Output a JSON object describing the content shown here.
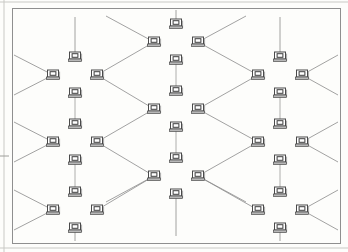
{
  "document": {
    "kind": "scanned-figure",
    "title": "Network topology diagram",
    "page_background": "#fdfdfb",
    "scan_edges": {
      "top_rule_y": 2,
      "left_rule_x": 4,
      "bottom_rule_y": 248,
      "left_tick_y": 156,
      "color": "#c9c9c5"
    }
  },
  "figure": {
    "frame": {
      "x": 12,
      "y": 8,
      "width": 328,
      "height": 235,
      "stroke": "#8f8f8f",
      "stroke_width": 1,
      "fill": "none"
    },
    "link_color": "#8a8a8a",
    "link_width": 0.8,
    "vertical_link_color": "#9a9a9a",
    "icon": {
      "name": "computer-monitor-icon",
      "screen_fill": "#ffffff",
      "screen_stroke": "#4a4a4a",
      "inner_fill": "#ffffff",
      "inner_stroke": "#3c3c3c",
      "base_fill": "#b8b8b8",
      "shadow_fill": "#b0b0b0",
      "width": 11,
      "height": 10
    },
    "cluster_offsets": {
      "left_dx": -22,
      "right_dx": 22,
      "top_dy": -18,
      "bottom_dy": 18
    },
    "clusters": [
      {
        "id": "c-l1",
        "label": "cluster-left-1",
        "column": "left",
        "row": 1,
        "cx": 75,
        "cy": 75
      },
      {
        "id": "c-l2",
        "label": "cluster-left-2",
        "column": "left",
        "row": 2,
        "cx": 75,
        "cy": 142
      },
      {
        "id": "c-l3",
        "label": "cluster-left-3",
        "column": "left",
        "row": 3,
        "cx": 75,
        "cy": 210
      },
      {
        "id": "c-m1",
        "label": "cluster-middle-1",
        "column": "middle",
        "row": 1,
        "cx": 176,
        "cy": 42
      },
      {
        "id": "c-m2",
        "label": "cluster-middle-2",
        "column": "middle",
        "row": 2,
        "cx": 176,
        "cy": 109
      },
      {
        "id": "c-m3",
        "label": "cluster-middle-3",
        "column": "middle",
        "row": 3,
        "cx": 176,
        "cy": 176
      },
      {
        "id": "c-r1",
        "label": "cluster-right-1",
        "column": "right",
        "row": 1,
        "cx": 280,
        "cy": 75
      },
      {
        "id": "c-r2",
        "label": "cluster-right-2",
        "column": "right",
        "row": 2,
        "cx": 280,
        "cy": 142
      },
      {
        "id": "c-r3",
        "label": "cluster-right-3",
        "column": "right",
        "row": 3,
        "cx": 280,
        "cy": 210
      }
    ],
    "diagonal_links": [
      {
        "from": "c-l1",
        "to": "c-m1"
      },
      {
        "from": "c-l1",
        "to": "c-m2"
      },
      {
        "from": "c-l2",
        "to": "c-m2"
      },
      {
        "from": "c-l2",
        "to": "c-m3"
      },
      {
        "from": "c-l3",
        "to": "c-m3"
      },
      {
        "from": "c-m1",
        "to": "c-r1"
      },
      {
        "from": "c-m2",
        "to": "c-r1"
      },
      {
        "from": "c-m2",
        "to": "c-r2"
      },
      {
        "from": "c-m3",
        "to": "c-r2"
      },
      {
        "from": "c-m3",
        "to": "c-r3"
      }
    ],
    "vertical_links": [
      {
        "from": "c-l1",
        "to": "c-l2"
      },
      {
        "from": "c-l2",
        "to": "c-l3"
      },
      {
        "from": "c-m1",
        "to": "c-m2"
      },
      {
        "from": "c-m2",
        "to": "c-m3"
      },
      {
        "from": "c-r1",
        "to": "c-r2"
      },
      {
        "from": "c-r2",
        "to": "c-r3"
      }
    ],
    "stub_links": [
      {
        "from": "c-l1",
        "node": "left",
        "dx": -42,
        "dy": -20
      },
      {
        "from": "c-l1",
        "node": "left",
        "dx": -42,
        "dy": 20
      },
      {
        "from": "c-l2",
        "node": "left",
        "dx": -42,
        "dy": -20
      },
      {
        "from": "c-l2",
        "node": "left",
        "dx": -42,
        "dy": 20
      },
      {
        "from": "c-l3",
        "node": "left",
        "dx": -42,
        "dy": -20
      },
      {
        "from": "c-l3",
        "node": "left",
        "dx": -42,
        "dy": 20
      },
      {
        "from": "c-r1",
        "node": "right",
        "dx": 42,
        "dy": -20
      },
      {
        "from": "c-r1",
        "node": "right",
        "dx": 42,
        "dy": 20
      },
      {
        "from": "c-r2",
        "node": "right",
        "dx": 42,
        "dy": -20
      },
      {
        "from": "c-r2",
        "node": "right",
        "dx": 42,
        "dy": 20
      },
      {
        "from": "c-r3",
        "node": "right",
        "dx": 42,
        "dy": -20
      },
      {
        "from": "c-r3",
        "node": "right",
        "dx": 42,
        "dy": 20
      },
      {
        "from": "c-m1",
        "node": "top",
        "dx": 0,
        "dy": -22
      },
      {
        "from": "c-l1",
        "node": "top",
        "dx": 0,
        "dy": -40
      },
      {
        "from": "c-r1",
        "node": "top",
        "dx": 0,
        "dy": -40
      },
      {
        "from": "c-l3",
        "node": "bottom",
        "dx": 0,
        "dy": 22
      },
      {
        "from": "c-r3",
        "node": "bottom",
        "dx": 0,
        "dy": 22
      },
      {
        "from": "c-m3",
        "node": "bottom",
        "dx": 0,
        "dy": 42
      },
      {
        "from": "c-m1",
        "node": "left",
        "dx": -48,
        "dy": -26
      },
      {
        "from": "c-m1",
        "node": "right",
        "dx": 48,
        "dy": -26
      },
      {
        "from": "c-m3",
        "node": "left",
        "dx": -48,
        "dy": 26
      },
      {
        "from": "c-m3",
        "node": "right",
        "dx": 48,
        "dy": 26
      }
    ]
  }
}
